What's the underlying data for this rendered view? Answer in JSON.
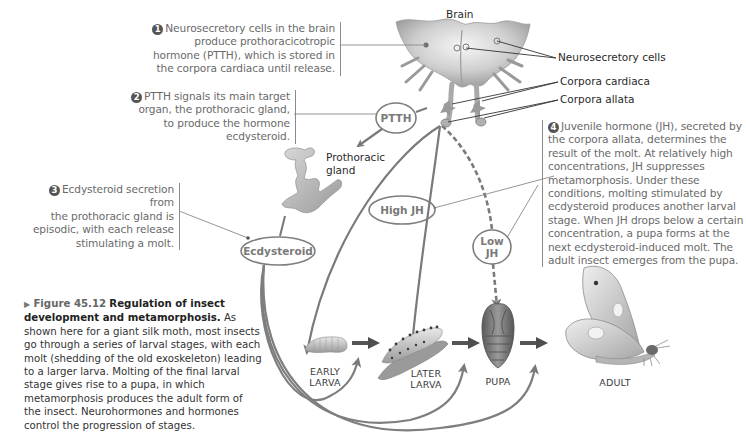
{
  "figure": {
    "arrow_marker": "▶",
    "number": "Figure 45.12",
    "title": "Regulation of insect development and metamorphosis.",
    "caption": "As shown here for a giant silk moth, most insects go through a series of larval stages, with each molt (shedding of the old exoskeleton) leading to a larger larva. Molting of the final larval stage gives rise to a pupa, in which metamorphosis produces the adult form of the insect. Neurohormones and hormones control the progression of stages."
  },
  "callouts": [
    {
      "number": "1",
      "lines": [
        "Neurosecretory cells in the brain",
        "produce prothoracicotropic",
        "hormone (PTTH), which is stored in",
        "the corpora cardiaca until release."
      ]
    },
    {
      "number": "2",
      "lines": [
        "PTTH signals its main target",
        "organ, the prothoracic gland,",
        "to produce the hormone",
        "ecdysteroid."
      ]
    },
    {
      "number": "3",
      "lines": [
        "Ecdysteroid secretion from",
        "the prothoracic gland is",
        "episodic, with each release",
        "stimulating a molt."
      ]
    },
    {
      "number": "4",
      "lines": [
        "Juvenile hormone (JH), secreted by",
        "the corpora allata, determines the",
        "result of the molt. At relatively high",
        "concentrations, JH suppresses",
        "metamorphosis. Under these",
        "conditions, molting stimulated by",
        "ecdysteroid produces another larval",
        "stage. When JH drops below a certain",
        "concentration, a pupa forms at the",
        "next ecdysteroid-induced molt. The",
        "adult insect emerges from the pupa."
      ]
    }
  ],
  "anatomy_labels": {
    "brain": "Brain",
    "neurosecretory_cells": "Neurosecretory cells",
    "corpora_cardiaca": "Corpora cardiaca",
    "corpora_allata": "Corpora allata",
    "prothoracic_gland_line1": "Prothoracic",
    "prothoracic_gland_line2": "gland"
  },
  "hormone_ovals": {
    "ptth": "PTTH",
    "ecdysteroid": "Ecdysteroid",
    "high_jh": "High JH",
    "low_jh_line1": "Low",
    "low_jh_line2": "JH"
  },
  "stages": {
    "early_larva_line1": "EARLY",
    "early_larva_line2": "LARVA",
    "later_larva_line1": "LATER",
    "later_larva_line2": "LARVA",
    "pupa": "PUPA",
    "adult": "ADULT"
  },
  "colors": {
    "arrow": "#7a7a7a",
    "callout_text": "#6a6a6a",
    "label_text": "#2a2a2a",
    "number_badge": "#555555"
  }
}
